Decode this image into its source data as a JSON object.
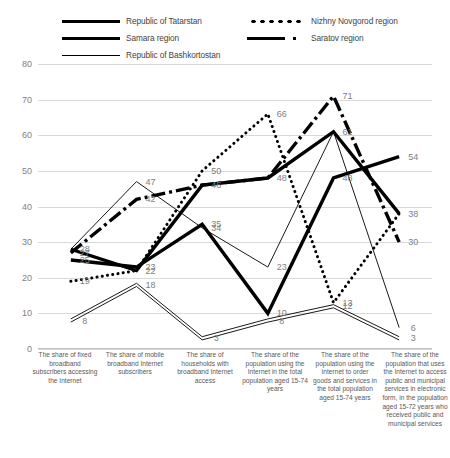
{
  "chart_data": {
    "type": "line",
    "title": "",
    "xlabel": "",
    "ylabel": "",
    "ylim": [
      0,
      80
    ],
    "yticks": [
      0,
      10,
      20,
      30,
      40,
      50,
      60,
      70,
      80
    ],
    "grid": true,
    "legend_position": "top",
    "categories": [
      "The share of fixed broadband subscribers accessing the Internet",
      "The share of mobile broadband Internet subscribers",
      "The share of households with broadband Internet access",
      "The share of the population using the Internet in the total population aged 15-74 years",
      "The share of the population using the Internet to order goods and services in the total population aged 15-74 years",
      "The share of the population that uses the Internet to access public and municipal services in electronic form, in the population aged 15-72 years who received public and municipal services"
    ],
    "series": [
      {
        "name": "Republic of Tatarstan",
        "style": "thick-solid",
        "values": [
          25,
          23,
          35,
          10,
          48,
          54
        ],
        "labels": [
          "25",
          "23",
          "35",
          "10",
          "48",
          "54"
        ]
      },
      {
        "name": "Samara region",
        "style": "thick-solid",
        "values": [
          28,
          22,
          46,
          48,
          61,
          38
        ],
        "labels": [
          "28",
          "22",
          "46",
          "48",
          "61",
          "38"
        ]
      },
      {
        "name": "Republic of Bashkortostan",
        "style": "thin-solid",
        "values": [
          28,
          47,
          34,
          23,
          61,
          6
        ],
        "labels": [
          "28",
          "47",
          "34",
          "23",
          "61",
          "6"
        ]
      },
      {
        "name": "Nizhny Novgorod region",
        "style": "dotted",
        "values": [
          19,
          22,
          50,
          66,
          13,
          38
        ],
        "labels": [
          "19",
          "22",
          "50",
          "66",
          "13",
          "38"
        ]
      },
      {
        "name": "Saratov region",
        "style": "dash-dot",
        "values": [
          27,
          42,
          46,
          48,
          71,
          30
        ],
        "labels": [
          "27",
          "42",
          "46",
          "48",
          "71",
          "30"
        ]
      },
      {
        "name": "Second line",
        "style": "double-thin",
        "values": [
          8,
          18,
          3,
          8,
          12,
          3
        ],
        "labels": [
          "8",
          "18",
          "3",
          "8",
          "12",
          "3"
        ]
      }
    ],
    "point_labels": [
      {
        "text": "28",
        "x": 0,
        "y": 28
      },
      {
        "text": "27",
        "x": 0,
        "y": 27
      },
      {
        "text": "25",
        "x": 0,
        "y": 25
      },
      {
        "text": "19",
        "x": 0,
        "y": 19
      },
      {
        "text": "8",
        "x": 0,
        "y": 8
      },
      {
        "text": "47",
        "x": 1,
        "y": 47
      },
      {
        "text": "42",
        "x": 1,
        "y": 42
      },
      {
        "text": "23",
        "x": 1,
        "y": 23
      },
      {
        "text": "22",
        "x": 1,
        "y": 22
      },
      {
        "text": "18",
        "x": 1,
        "y": 18
      },
      {
        "text": "50",
        "x": 2,
        "y": 50
      },
      {
        "text": "46",
        "x": 2,
        "y": 46
      },
      {
        "text": "35",
        "x": 2,
        "y": 35
      },
      {
        "text": "34",
        "x": 2,
        "y": 34
      },
      {
        "text": "3",
        "x": 2,
        "y": 3
      },
      {
        "text": "66",
        "x": 3,
        "y": 66
      },
      {
        "text": "48",
        "x": 3,
        "y": 48
      },
      {
        "text": "23",
        "x": 3,
        "y": 23
      },
      {
        "text": "10",
        "x": 3,
        "y": 10
      },
      {
        "text": "8",
        "x": 3,
        "y": 8
      },
      {
        "text": "71",
        "x": 4,
        "y": 71
      },
      {
        "text": "61",
        "x": 4,
        "y": 61
      },
      {
        "text": "48",
        "x": 4,
        "y": 48
      },
      {
        "text": "13",
        "x": 4,
        "y": 13
      },
      {
        "text": "12",
        "x": 4,
        "y": 12
      },
      {
        "text": "54",
        "x": 5,
        "y": 54
      },
      {
        "text": "38",
        "x": 5,
        "y": 38
      },
      {
        "text": "30",
        "x": 5,
        "y": 30
      },
      {
        "text": "6",
        "x": 5,
        "y": 6
      },
      {
        "text": "3",
        "x": 5,
        "y": 3
      }
    ]
  },
  "legend": {
    "items": [
      {
        "label": "Republic of Tatarstan",
        "style": "thick-solid",
        "column": "left"
      },
      {
        "label": "Samara region",
        "style": "thick-solid",
        "column": "left"
      },
      {
        "label": "Republic of Bashkortostan",
        "style": "thin-solid",
        "column": "left"
      },
      {
        "label": "Nizhny Novgorod region",
        "style": "dotted",
        "column": "right"
      },
      {
        "label": "Saratov region",
        "style": "dash-dot",
        "column": "right"
      }
    ]
  }
}
